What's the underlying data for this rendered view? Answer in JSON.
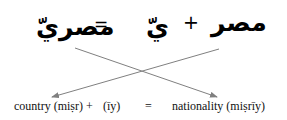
{
  "arabic_row": {
    "result_word": "مصريّ",
    "equals": "=",
    "suffix": "يّ",
    "plus": "+",
    "root_word": "مصر"
  },
  "english_row": {
    "country": "country (miṣr) +",
    "suffix": "(īy)",
    "equals": "=",
    "nationality": "nationality (miṣrīy)"
  },
  "colors": {
    "text": "#000000",
    "arrow": "#808080"
  }
}
